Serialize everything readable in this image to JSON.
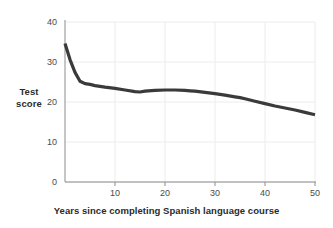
{
  "chart_data": {
    "type": "line",
    "title": "",
    "xlabel": "Years since completing Spanish language course",
    "ylabel": "Test score",
    "ylabel_line1": "Test",
    "ylabel_line2": "score",
    "xlim": [
      0,
      50
    ],
    "ylim": [
      0,
      40
    ],
    "xticks": [
      10,
      20,
      30,
      40,
      50
    ],
    "xtick_labels": [
      "10",
      "20",
      "30",
      "40",
      "50"
    ],
    "yticks": [
      0,
      10,
      20,
      30,
      40
    ],
    "ytick_labels": [
      "0",
      "10",
      "20",
      "30",
      "40"
    ],
    "grid": true,
    "legend": "none",
    "series": [
      {
        "name": "Test score",
        "color": "#3a3a3a",
        "line_width": 3.2,
        "x": [
          0,
          1,
          2,
          3,
          4,
          5,
          6,
          8,
          10,
          12,
          14,
          15,
          16,
          18,
          20,
          22,
          24,
          25,
          26,
          28,
          30,
          32,
          34,
          35,
          36,
          38,
          40,
          42,
          44,
          46,
          48,
          50
        ],
        "y": [
          34.6,
          30.6,
          27.4,
          25.2,
          24.6,
          24.4,
          24.1,
          23.7,
          23.4,
          23.0,
          22.6,
          22.5,
          22.7,
          22.9,
          23.0,
          23.0,
          22.9,
          22.8,
          22.7,
          22.4,
          22.1,
          21.7,
          21.3,
          21.1,
          20.8,
          20.2,
          19.6,
          19.0,
          18.5,
          18.0,
          17.4,
          16.8
        ]
      }
    ]
  },
  "style": {
    "line_color": "#3a3a3a",
    "grid_color": "#ececec",
    "axis_color": "#8d8d8d",
    "text_color": "#2b2b2b",
    "background": "#ffffff"
  }
}
